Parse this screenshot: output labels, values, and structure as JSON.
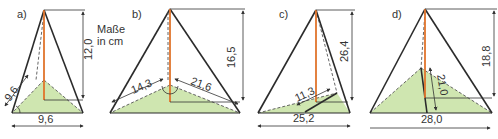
{
  "note": {
    "line1": "Maße",
    "line2": "in cm"
  },
  "colors": {
    "height_line": "#e0742c",
    "base_fill": "#cfe6b0",
    "edges": "#2b2b2b"
  },
  "figures": [
    {
      "label": "a)",
      "base": "9,6",
      "side": "9,6",
      "height": "12,0"
    },
    {
      "label": "b)",
      "left": "14,3",
      "right": "21,6",
      "height": "16,5"
    },
    {
      "label": "c)",
      "base": "25,2",
      "inner": "11,3",
      "height": "26,4"
    },
    {
      "label": "d)",
      "base": "28,0",
      "inner": "21,0",
      "height": "18,8"
    }
  ]
}
